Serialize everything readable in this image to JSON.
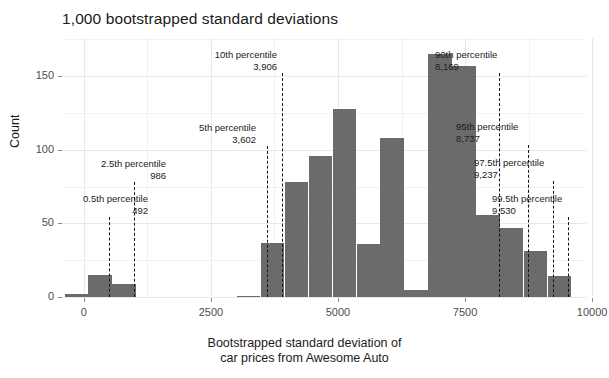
{
  "chart_data": {
    "type": "bar",
    "title": "1,000 bootstrapped standard deviations",
    "xlabel_line1": "Bootstrapped standard deviation of",
    "xlabel_line2": "car prices from Awesome Auto",
    "ylabel": "Count",
    "xlim": [
      -430,
      9880
    ],
    "ylim": [
      0,
      176
    ],
    "grid": true,
    "legend": "none",
    "bin_width": 471,
    "bar_color": "#6b6b6b",
    "xticks": [
      {
        "value": 0,
        "label": "0"
      },
      {
        "value": 2500,
        "label": "2500"
      },
      {
        "value": 5000,
        "label": "5000"
      },
      {
        "value": 7500,
        "label": "7500"
      },
      {
        "value": 10000,
        "label": "10000"
      }
    ],
    "yticks": [
      {
        "value": 0,
        "label": "0"
      },
      {
        "value": 50,
        "label": "50"
      },
      {
        "value": 100,
        "label": "100"
      },
      {
        "value": 150,
        "label": "150"
      }
    ],
    "y_minor_ticks": [
      25,
      75,
      125,
      175
    ],
    "bins": [
      {
        "x0": -380,
        "x1": 91,
        "count": 2
      },
      {
        "x0": 91,
        "x1": 562,
        "count": 15
      },
      {
        "x0": 562,
        "x1": 1033,
        "count": 9
      },
      {
        "x0": 3010,
        "x1": 3481,
        "count": 1
      },
      {
        "x0": 3481,
        "x1": 3952,
        "count": 37
      },
      {
        "x0": 3952,
        "x1": 4423,
        "count": 78
      },
      {
        "x0": 4423,
        "x1": 4894,
        "count": 96
      },
      {
        "x0": 4894,
        "x1": 5365,
        "count": 128
      },
      {
        "x0": 5365,
        "x1": 5836,
        "count": 36
      },
      {
        "x0": 5836,
        "x1": 6307,
        "count": 108
      },
      {
        "x0": 6307,
        "x1": 6778,
        "count": 5
      },
      {
        "x0": 6778,
        "x1": 7249,
        "count": 165
      },
      {
        "x0": 7249,
        "x1": 7720,
        "count": 157
      },
      {
        "x0": 7720,
        "x1": 8191,
        "count": 56
      },
      {
        "x0": 8191,
        "x1": 8662,
        "count": 47
      },
      {
        "x0": 8662,
        "x1": 9133,
        "count": 31
      },
      {
        "x0": 9133,
        "x1": 9604,
        "count": 14
      }
    ],
    "annotations": [
      {
        "id": "p0.5",
        "label": "0.5th percentile",
        "value_text": "492",
        "x": 492,
        "text_x_px": 148,
        "text_y_px": 193,
        "align": "right"
      },
      {
        "id": "p2.5",
        "label": "2.5th percentile",
        "value_text": "986",
        "x": 986,
        "text_x_px": 166,
        "text_y_px": 158,
        "align": "right"
      },
      {
        "id": "p5",
        "label": "5th percentile",
        "value_text": "3,602",
        "x": 3602,
        "text_x_px": 256,
        "text_y_px": 122,
        "align": "right"
      },
      {
        "id": "p10",
        "label": "10th percentile",
        "value_text": "3,906",
        "x": 3906,
        "text_x_px": 277,
        "text_y_px": 49,
        "align": "right"
      },
      {
        "id": "p90",
        "label": "90th percentile",
        "value_text": "8,169",
        "x": 8169,
        "text_x_px": 435,
        "text_y_px": 49,
        "align": "left"
      },
      {
        "id": "p95",
        "label": "95th percentile",
        "value_text": "8,737",
        "x": 8737,
        "text_x_px": 456,
        "text_y_px": 121,
        "align": "left"
      },
      {
        "id": "p97.5",
        "label": "97.5th percentile",
        "value_text": "9,237",
        "x": 9237,
        "text_x_px": 474,
        "text_y_px": 157,
        "align": "left"
      },
      {
        "id": "p99.5",
        "label": "99.5th percentile",
        "value_text": "9,530",
        "x": 9530,
        "text_x_px": 492,
        "text_y_px": 193,
        "align": "left"
      }
    ]
  }
}
